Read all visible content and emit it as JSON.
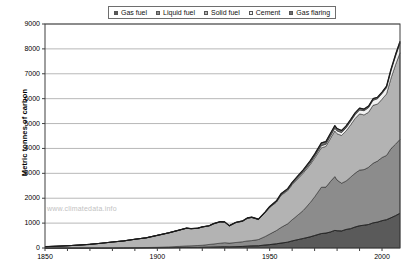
{
  "chart_data": {
    "type": "area",
    "stacked": true,
    "title": "",
    "subtitle": "",
    "xlabel": "",
    "ylabel": "Metric tonnes of carbon",
    "xlim": [
      1850,
      2008
    ],
    "ylim": [
      0,
      9000
    ],
    "y_ticks": [
      0,
      1000,
      2000,
      3000,
      4000,
      5000,
      6000,
      7000,
      8000,
      9000
    ],
    "y_tick_labels": [
      "0",
      "1000",
      "2000",
      "3000",
      "4000",
      "5000",
      "6000",
      "7000",
      "8000",
      "9000"
    ],
    "x_ticks": [
      1850,
      1900,
      1950,
      2000
    ],
    "x_tick_labels": [
      "1850",
      "1900",
      "1950",
      "2000"
    ],
    "grid": "horizontal",
    "legend_position": "top",
    "watermark": "www.climatedata.info",
    "x": [
      1850,
      1855,
      1860,
      1865,
      1870,
      1875,
      1880,
      1885,
      1890,
      1895,
      1900,
      1905,
      1910,
      1913,
      1915,
      1918,
      1920,
      1923,
      1925,
      1928,
      1930,
      1932,
      1935,
      1938,
      1940,
      1942,
      1945,
      1948,
      1950,
      1953,
      1955,
      1958,
      1960,
      1963,
      1965,
      1968,
      1970,
      1973,
      1975,
      1977,
      1979,
      1980,
      1982,
      1984,
      1986,
      1988,
      1990,
      1992,
      1994,
      1996,
      1998,
      2000,
      2002,
      2004,
      2006,
      2008
    ],
    "series": [
      {
        "name": "Gas fuel",
        "color": "#5a5a5a",
        "values": [
          0,
          0,
          0,
          0,
          0,
          1,
          1,
          2,
          3,
          5,
          8,
          12,
          18,
          22,
          22,
          24,
          27,
          33,
          37,
          45,
          50,
          45,
          53,
          63,
          74,
          85,
          90,
          121,
          136,
          169,
          196,
          234,
          285,
          345,
          384,
          448,
          501,
          581,
          598,
          642,
          707,
          694,
          685,
          744,
          777,
          842,
          893,
          916,
          944,
          1009,
          1041,
          1098,
          1137,
          1215,
          1299,
          1394
        ]
      },
      {
        "name": "Liquid fuel",
        "color": "#8c8c8c",
        "values": [
          0,
          0,
          0,
          1,
          1,
          2,
          4,
          6,
          10,
          14,
          20,
          33,
          49,
          62,
          67,
          76,
          84,
          109,
          125,
          148,
          164,
          151,
          169,
          189,
          210,
          212,
          250,
          342,
          423,
          533,
          627,
          740,
          849,
          1013,
          1131,
          1372,
          1553,
          1861,
          1848,
          2026,
          2164,
          2034,
          1918,
          1947,
          2068,
          2162,
          2237,
          2234,
          2299,
          2394,
          2452,
          2538,
          2582,
          2780,
          2869,
          2974
        ]
      },
      {
        "name": "Solid fuel",
        "color": "#b3b3b3",
        "values": [
          54,
          71,
          91,
          117,
          148,
          188,
          236,
          276,
          339,
          391,
          481,
          562,
          655,
          711,
          685,
          690,
          733,
          743,
          806,
          855,
          822,
          690,
          797,
          821,
          902,
          926,
          802,
          960,
          1070,
          1139,
          1288,
          1331,
          1410,
          1472,
          1504,
          1530,
          1556,
          1587,
          1635,
          1727,
          1834,
          1863,
          1919,
          2010,
          2100,
          2200,
          2259,
          2197,
          2211,
          2330,
          2290,
          2343,
          2470,
          2830,
          3194,
          3475
        ]
      },
      {
        "name": "Cement",
        "color": "#f2f2f2",
        "values": [
          0,
          0,
          0,
          0,
          0,
          0,
          0,
          0,
          0,
          0,
          1,
          2,
          3,
          4,
          4,
          4,
          5,
          6,
          7,
          9,
          9,
          7,
          9,
          12,
          12,
          10,
          8,
          14,
          18,
          23,
          28,
          33,
          39,
          47,
          53,
          62,
          70,
          84,
          87,
          98,
          108,
          111,
          115,
          125,
          137,
          149,
          156,
          169,
          185,
          204,
          214,
          226,
          251,
          298,
          342,
          386
        ]
      },
      {
        "name": "Gas flaring",
        "color": "#707070",
        "values": [
          0,
          0,
          0,
          0,
          0,
          0,
          0,
          0,
          0,
          0,
          0,
          0,
          1,
          1,
          1,
          2,
          2,
          3,
          4,
          5,
          6,
          5,
          6,
          8,
          9,
          10,
          11,
          16,
          23,
          32,
          39,
          47,
          55,
          68,
          76,
          87,
          92,
          112,
          106,
          105,
          105,
          97,
          85,
          79,
          76,
          78,
          78,
          67,
          62,
          62,
          62,
          62,
          62,
          65,
          68,
          70
        ]
      }
    ]
  },
  "legend": {
    "items": [
      {
        "label": "Gas fuel",
        "color": "#5a5a5a"
      },
      {
        "label": "Liquid fuel",
        "color": "#8c8c8c"
      },
      {
        "label": "Solid fuel",
        "color": "#b3b3b3"
      },
      {
        "label": "Cement",
        "color": "#f2f2f2"
      },
      {
        "label": "Gas flaring",
        "color": "#707070"
      }
    ]
  },
  "axes": {
    "y_title": "Metric tonnes of carbon"
  },
  "watermark": {
    "text": "www.climatedata.info"
  },
  "colors": {
    "plot_border": "#3f3f3f",
    "gridline": "#9a9a9a",
    "background": "#ffffff",
    "outline": "#1a1a1a"
  }
}
